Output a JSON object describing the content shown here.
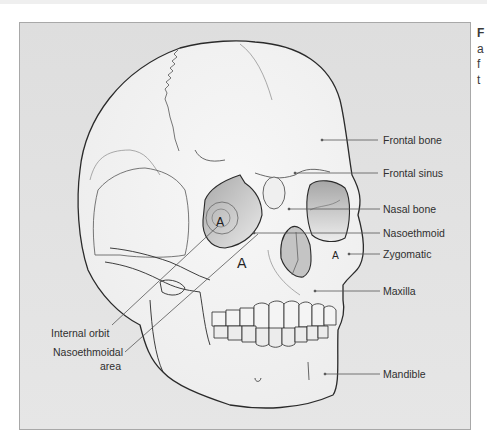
{
  "figure": {
    "panel_background": "#e2e2e2",
    "outline_color": "#2a2a2a",
    "leader_color": "#555555",
    "shading_color": "#b8b8b8",
    "labels": {
      "frontal_bone": "Frontal bone",
      "frontal_sinus": "Frontal sinus",
      "nasal_bone": "Nasal bone",
      "nasoethmoid": "Nasoethmoid",
      "zygomatic": "Zygomatic",
      "maxilla": "Maxilla",
      "mandible": "Mandible",
      "internal_orbit": "Internal orbit",
      "nasoethmoidal_area_line1": "Nasoethmoidal",
      "nasoethmoidal_area_line2": "area"
    },
    "region_markers": {
      "orbit_marker": "A",
      "cheek_marker_left": "A",
      "cheek_marker_right": "A"
    }
  },
  "caption_fragment": {
    "line1": "F",
    "line2": "a",
    "line3": "f",
    "line4": "t"
  }
}
